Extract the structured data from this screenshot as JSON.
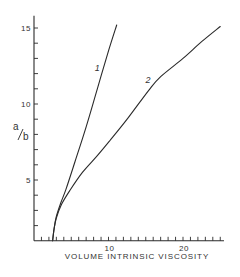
{
  "chart_data": {
    "type": "line",
    "title": "",
    "xlabel": "VOLUME INTRINSIC VISCOSITY",
    "ylabel": "a/b",
    "xlim": [
      0,
      25.5
    ],
    "ylim": [
      1,
      15.8
    ],
    "x_ticks_major": [
      10,
      20
    ],
    "x_tick_labels": [
      "10",
      "20"
    ],
    "x_ticks_minor_step": 1,
    "y_ticks_major": [
      5,
      10,
      15
    ],
    "y_tick_labels": [
      "5",
      "10",
      "15"
    ],
    "y_ticks_minor_step": 1,
    "grid": false,
    "legend": null,
    "series": [
      {
        "name": "1",
        "x": [
          2.5,
          2.7,
          3.0,
          3.6,
          4.3,
          5.5,
          7.0,
          8.5,
          10.0,
          11.1
        ],
        "y": [
          1.0,
          1.8,
          2.6,
          3.5,
          4.4,
          6.2,
          8.5,
          11.0,
          13.5,
          15.2
        ]
      },
      {
        "name": "2",
        "x": [
          2.5,
          2.7,
          3.0,
          3.7,
          4.8,
          6.5,
          8.5,
          10.2,
          12.5,
          15.4,
          17.0,
          20.0,
          22.5,
          25.0
        ],
        "y": [
          1.0,
          1.8,
          2.5,
          3.4,
          4.3,
          5.5,
          6.6,
          7.6,
          9.0,
          10.9,
          11.8,
          13.0,
          14.1,
          15.1
        ]
      }
    ],
    "annotations": [
      {
        "text": "1",
        "x": 8.5,
        "y": 12.2,
        "refers_to": "series 1"
      },
      {
        "text": "2",
        "x": 15.3,
        "y": 11.4,
        "refers_to": "series 2"
      }
    ]
  },
  "layout": {
    "x0_px": 34,
    "x_px_per_unit": 7.45,
    "y0_px": 256,
    "y_px_per_unit": 15.2,
    "axis_title_y_px": 259,
    "ylabel_px": [
      13,
      130
    ],
    "colors": {
      "ink": "#2a2a2a",
      "background": "#ffffff"
    }
  }
}
